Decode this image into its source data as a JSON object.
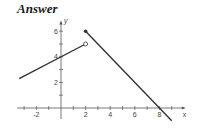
{
  "header": {
    "title": "Answer"
  },
  "chart_data": {
    "type": "line",
    "title": "Answer",
    "xlabel": "x",
    "ylabel": "y",
    "xlim": [
      -3.4,
      10
    ],
    "ylim": [
      -1.2,
      6.8
    ],
    "grid": false,
    "x_tick_labels": [
      "-2",
      "2",
      "4",
      "6",
      "8"
    ],
    "x_tick_values": [
      -2,
      2,
      4,
      6,
      8
    ],
    "x_minor_ticks": [
      -3,
      -1,
      1,
      3,
      5,
      7,
      9
    ],
    "y_tick_labels": [
      "2",
      "4",
      "6"
    ],
    "y_tick_values": [
      2,
      4,
      6
    ],
    "y_minor_ticks": [
      1,
      3,
      5
    ],
    "series": [
      {
        "name": "segment-1",
        "formula": "y = x/2 + 4",
        "x": [
          -3.4,
          2
        ],
        "y": [
          2.3,
          5
        ],
        "start": "continues",
        "end": "open-circle"
      },
      {
        "name": "segment-2",
        "formula": "y = -x + 8",
        "x": [
          2,
          9
        ],
        "y": [
          6,
          -1
        ],
        "start": "filled-dot",
        "end": "continues"
      }
    ],
    "annotations": [
      {
        "type": "open-circle",
        "x": 2,
        "y": 5
      },
      {
        "type": "filled-dot",
        "x": 2,
        "y": 6
      }
    ]
  },
  "colors": {
    "line": "#333333",
    "axis": "#555555",
    "text": "#1a1a1a"
  }
}
